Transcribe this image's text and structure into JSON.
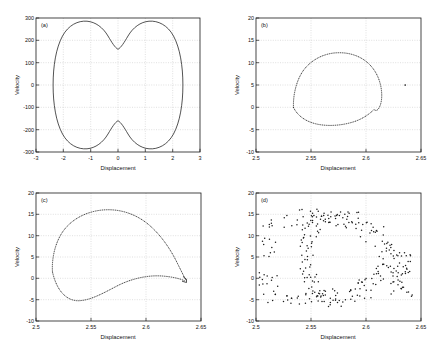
{
  "figure": {
    "background_color": "#ffffff",
    "axis_color": "#1a1a1a",
    "grid_color": "#b9b9b9",
    "panel_count": 4
  },
  "chart_data": [
    {
      "type": "line",
      "panel": "(a)",
      "title": "",
      "xlabel": "Displacement",
      "ylabel": "Velocity",
      "xlim": [
        -3,
        3
      ],
      "ylim": [
        -300,
        300
      ],
      "xticks": [
        -3,
        -2,
        -1,
        0,
        1,
        2,
        3
      ],
      "xticklabels": [
        "-3",
        "-2",
        "-1",
        "0",
        "1",
        "2",
        "3"
      ],
      "yticks": [
        -300,
        -200,
        -100,
        0,
        100,
        200,
        300
      ],
      "yticklabels": [
        "-300",
        "-200",
        "-100",
        "0",
        "100",
        "200",
        "300"
      ],
      "grid": true,
      "legend": false,
      "marker": "none",
      "linestyle": "solid",
      "description": "Closed peanut/dumbbell shaped limit cycle, symmetric about both axes, with upper lobe peaks near 280 at x=-1.5 and x=1.5 and a saddle dip to 200 at x=0; mirrored below.",
      "x": [
        -2.6,
        -2.58,
        -2.52,
        -2.42,
        -2.28,
        -2.1,
        -1.9,
        -1.7,
        -1.5,
        -1.3,
        -1.1,
        -0.85,
        -0.6,
        -0.35,
        -0.15,
        0.0,
        0.15,
        0.35,
        0.6,
        0.85,
        1.1,
        1.3,
        1.5,
        1.7,
        1.9,
        2.1,
        2.28,
        2.42,
        2.52,
        2.58,
        2.6
      ],
      "y": [
        0,
        60,
        120,
        175,
        215,
        245,
        265,
        277,
        281,
        277,
        268,
        250,
        230,
        212,
        203,
        200,
        203,
        212,
        230,
        250,
        268,
        277,
        281,
        277,
        265,
        245,
        215,
        175,
        120,
        60,
        0
      ]
    },
    {
      "type": "scatter",
      "panel": "(b)",
      "title": "",
      "xlabel": "Displacement",
      "ylabel": "Velocity",
      "xlim": [
        2.5,
        2.65
      ],
      "ylim": [
        -10,
        20
      ],
      "xticks": [
        2.5,
        2.55,
        2.6,
        2.65
      ],
      "xticklabels": [
        "2.5",
        "2.55",
        "2.6",
        "2.65"
      ],
      "yticks": [
        -10,
        -5,
        0,
        5,
        10,
        15,
        20
      ],
      "yticklabels": [
        "-10",
        "-5",
        "0",
        "5",
        "10",
        "15",
        "20"
      ],
      "grid": true,
      "legend": false,
      "marker": "dot",
      "linestyle": "dotted",
      "description": "Dotted closed teardrop orbit spanning x from 2.533 to 2.617 and y from -4 to 12, with a sharp corner near (2.615, 0), plus one isolated outlier point at roughly (2.636, 5).",
      "outlier_point": [
        2.636,
        5.0
      ]
    },
    {
      "type": "scatter",
      "panel": "(c)",
      "title": "",
      "xlabel": "Displacement",
      "ylabel": "Velocity",
      "xlim": [
        2.5,
        2.65
      ],
      "ylim": [
        -10,
        20
      ],
      "xticks": [
        2.5,
        2.55,
        2.6,
        2.65
      ],
      "xticklabels": [
        "2.5",
        "2.55",
        "2.6",
        "2.65"
      ],
      "yticks": [
        -10,
        -5,
        0,
        5,
        10,
        15,
        20
      ],
      "yticklabels": [
        "-10",
        "-5",
        "0",
        "5",
        "10",
        "15",
        "20"
      ],
      "grid": true,
      "legend": false,
      "marker": "dot",
      "linestyle": "dotted",
      "description": "Larger dotted teardrop orbit spanning x from 2.515 to 2.637 and y from -5.5 to 15, with a pronounced cusp/hook at the right end near (2.636, -0.5).",
      "cusp_point": [
        2.636,
        -0.5
      ]
    },
    {
      "type": "scatter",
      "panel": "(d)",
      "title": "",
      "xlabel": "Displacement",
      "ylabel": "Velocity",
      "xlim": [
        2.5,
        2.65
      ],
      "ylim": [
        -10,
        20
      ],
      "xticks": [
        2.5,
        2.55,
        2.6,
        2.65
      ],
      "xticklabels": [
        "2.5",
        "2.55",
        "2.6",
        "2.65"
      ],
      "yticks": [
        -10,
        -5,
        0,
        5,
        10,
        15,
        20
      ],
      "yticklabels": [
        "-10",
        "-5",
        "0",
        "5",
        "10",
        "15",
        "20"
      ],
      "grid": true,
      "legend": false,
      "marker": "dot",
      "linestyle": "none",
      "description": "Scattered, noisy cloud of points loosely tracing a broad ring/annulus shape; dense clustering near the right edge around x=2.63 between y=-4 and y=5, upper arc near y=13-16 between x=2.51 and 2.59, lower arc near y=-5 between x=2.51 and 2.60."
    }
  ],
  "labels": {
    "displacement": "Displacement",
    "velocity": "Velocity",
    "tag_a": "(a)",
    "tag_b": "(b)",
    "tag_c": "(c)",
    "tag_d": "(d)"
  }
}
